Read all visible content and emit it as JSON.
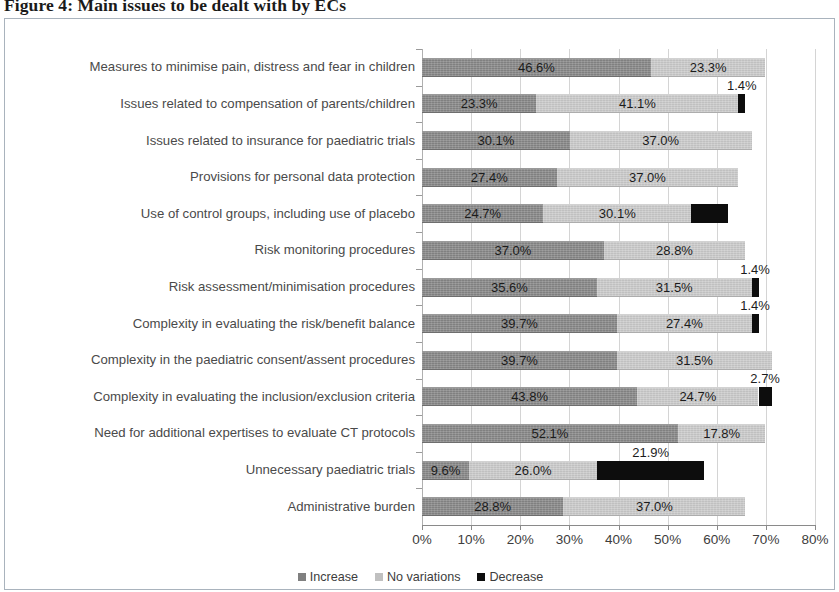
{
  "figure": {
    "title": "Figure 4: Main issues to be dealt with by ECs"
  },
  "legend": {
    "position": "bottom-center",
    "items": [
      {
        "label": "Increase",
        "color": "#808080",
        "icon": "square-swatch-icon"
      },
      {
        "label": "No variations",
        "color": "#c0c0c0",
        "icon": "square-swatch-icon"
      },
      {
        "label": "Decrease",
        "color": "#0d0d0d",
        "icon": "square-swatch-icon"
      }
    ]
  },
  "axis": {
    "x_ticks": [
      "0%",
      "10%",
      "20%",
      "30%",
      "40%",
      "50%",
      "60%",
      "70%",
      "80%"
    ],
    "x_min": 0,
    "x_max": 80,
    "x_step": 10
  },
  "chart_data": {
    "type": "bar",
    "orientation": "horizontal",
    "stacked": true,
    "title": "Figure 4: Main issues to be dealt with by ECs",
    "xlabel": "",
    "ylabel": "",
    "xlim": [
      0,
      80
    ],
    "grid": true,
    "legend_position": "bottom",
    "categories": [
      "Measures to minimise pain, distress and fear in children",
      "Issues related to compensation of parents/children",
      "Issues related to insurance for paediatric trials",
      "Provisions for personal data protection",
      "Use of control groups, including use of placebo",
      "Risk monitoring procedures",
      "Risk assessment/minimisation procedures",
      "Complexity in evaluating the risk/benefit balance",
      "Complexity in the paediatric consent/assent procedures",
      "Complexity in evaluating the inclusion/exclusion criteria",
      "Need for additional expertises to evaluate CT protocols",
      "Unnecessary paediatric trials",
      "Administrative burden"
    ],
    "series": [
      {
        "name": "Increase",
        "color": "#808080",
        "values": [
          46.6,
          23.3,
          30.1,
          27.4,
          24.7,
          37.0,
          35.6,
          39.7,
          39.7,
          43.8,
          52.1,
          9.6,
          28.8
        ]
      },
      {
        "name": "No variations",
        "color": "#c0c0c0",
        "values": [
          23.3,
          41.1,
          37.0,
          37.0,
          30.1,
          28.8,
          31.5,
          27.4,
          31.5,
          24.7,
          17.8,
          26.0,
          37.0
        ]
      },
      {
        "name": "Decrease",
        "color": "#0d0d0d",
        "values": [
          0,
          1.4,
          0,
          0,
          7.5,
          0,
          1.4,
          1.4,
          0,
          2.7,
          0,
          21.9,
          0
        ]
      }
    ],
    "data_labels": [
      {
        "row": 0,
        "series": "Increase",
        "text": "46.6%",
        "placement": "inside"
      },
      {
        "row": 0,
        "series": "No variations",
        "text": "23.3%",
        "placement": "inside"
      },
      {
        "row": 1,
        "series": "Increase",
        "text": "23.3%",
        "placement": "inside"
      },
      {
        "row": 1,
        "series": "No variations",
        "text": "41.1%",
        "placement": "inside"
      },
      {
        "row": 1,
        "series": "Decrease",
        "text": "1.4%",
        "placement": "above"
      },
      {
        "row": 2,
        "series": "Increase",
        "text": "30.1%",
        "placement": "inside"
      },
      {
        "row": 2,
        "series": "No variations",
        "text": "37.0%",
        "placement": "inside"
      },
      {
        "row": 3,
        "series": "Increase",
        "text": "27.4%",
        "placement": "inside"
      },
      {
        "row": 3,
        "series": "No variations",
        "text": "37.0%",
        "placement": "inside"
      },
      {
        "row": 4,
        "series": "Increase",
        "text": "24.7%",
        "placement": "inside"
      },
      {
        "row": 4,
        "series": "No variations",
        "text": "30.1%",
        "placement": "inside"
      },
      {
        "row": 5,
        "series": "Increase",
        "text": "37.0%",
        "placement": "inside"
      },
      {
        "row": 5,
        "series": "No variations",
        "text": "28.8%",
        "placement": "inside"
      },
      {
        "row": 6,
        "series": "Increase",
        "text": "35.6%",
        "placement": "inside"
      },
      {
        "row": 6,
        "series": "No variations",
        "text": "31.5%",
        "placement": "inside"
      },
      {
        "row": 6,
        "series": "Decrease",
        "text": "1.4%",
        "placement": "above"
      },
      {
        "row": 7,
        "series": "Increase",
        "text": "39.7%",
        "placement": "inside"
      },
      {
        "row": 7,
        "series": "No variations",
        "text": "27.4%",
        "placement": "inside"
      },
      {
        "row": 7,
        "series": "Decrease",
        "text": "1.4%",
        "placement": "above"
      },
      {
        "row": 8,
        "series": "Increase",
        "text": "39.7%",
        "placement": "inside"
      },
      {
        "row": 8,
        "series": "No variations",
        "text": "31.5%",
        "placement": "inside"
      },
      {
        "row": 9,
        "series": "Increase",
        "text": "43.8%",
        "placement": "inside"
      },
      {
        "row": 9,
        "series": "No variations",
        "text": "24.7%",
        "placement": "inside"
      },
      {
        "row": 9,
        "series": "Decrease",
        "text": "2.7%",
        "placement": "above"
      },
      {
        "row": 10,
        "series": "Increase",
        "text": "52.1%",
        "placement": "inside"
      },
      {
        "row": 10,
        "series": "No variations",
        "text": "17.8%",
        "placement": "inside"
      },
      {
        "row": 11,
        "series": "Increase",
        "text": "9.6%",
        "placement": "inside"
      },
      {
        "row": 11,
        "series": "No variations",
        "text": "26.0%",
        "placement": "inside"
      },
      {
        "row": 11,
        "series": "Decrease",
        "text": "21.9%",
        "placement": "above"
      },
      {
        "row": 12,
        "series": "Increase",
        "text": "28.8%",
        "placement": "inside"
      },
      {
        "row": 12,
        "series": "No variations",
        "text": "37.0%",
        "placement": "inside"
      }
    ]
  }
}
